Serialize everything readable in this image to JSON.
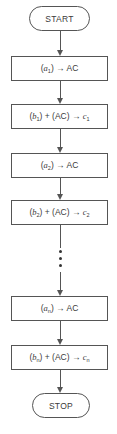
{
  "diagram": {
    "type": "flowchart",
    "nodes": [
      {
        "id": "start",
        "shape": "terminal",
        "label": "START"
      },
      {
        "id": "step1",
        "shape": "process",
        "label": "(a1) → AC",
        "var": "a",
        "sub": "1",
        "rest": ") → AC"
      },
      {
        "id": "step2",
        "shape": "process",
        "label": "(b1) + (AC) → c1",
        "var": "b",
        "sub": "1",
        "mid": ") + (AC) → ",
        "out": "c",
        "outsub": "1"
      },
      {
        "id": "step3",
        "shape": "process",
        "label": "(a2) → AC",
        "var": "a",
        "sub": "2",
        "rest": ") → AC"
      },
      {
        "id": "step4",
        "shape": "process",
        "label": "(b2) + (AC) → c2",
        "var": "b",
        "sub": "2",
        "mid": ") + (AC) → ",
        "out": "c",
        "outsub": "2"
      },
      {
        "id": "ellipsis",
        "shape": "vertical-dots",
        "label": "⋮"
      },
      {
        "id": "step5",
        "shape": "process",
        "label": "(an) → AC",
        "var": "a",
        "sub": "n",
        "rest": ") → AC"
      },
      {
        "id": "step6",
        "shape": "process",
        "label": "(bn) + (AC) → cn",
        "var": "b",
        "sub": "n",
        "mid": ") + (AC) → ",
        "out": "c",
        "outsub": "n"
      },
      {
        "id": "stop",
        "shape": "terminal",
        "label": "STOP"
      }
    ],
    "open_paren": "(",
    "edges": [
      [
        "start",
        "step1"
      ],
      [
        "step1",
        "step2"
      ],
      [
        "step2",
        "step3"
      ],
      [
        "step3",
        "step4"
      ],
      [
        "step4",
        "ellipsis"
      ],
      [
        "ellipsis",
        "step5"
      ],
      [
        "step5",
        "step6"
      ],
      [
        "step6",
        "stop"
      ]
    ],
    "colors": {
      "stroke": "#555555",
      "text": "#3a3a3a",
      "background": "#ffffff"
    }
  }
}
